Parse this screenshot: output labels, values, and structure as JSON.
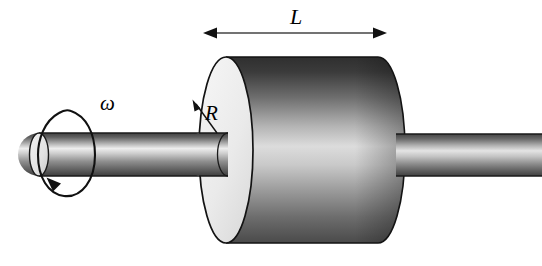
{
  "figure": {
    "background_color": "#ffffff",
    "width": 542,
    "height": 266,
    "labels": {
      "length": "L",
      "radius": "R",
      "angular_velocity": "ω"
    },
    "annotations": [
      {
        "name": "length-dimension",
        "symbol": "L",
        "kind": "double-headed-arrow",
        "meaning": "axial length of the cylinder"
      },
      {
        "name": "radius-dimension",
        "symbol": "R",
        "kind": "single-headed-leader-arrow",
        "meaning": "radius of the cylinder front face"
      },
      {
        "name": "rotation-indicator",
        "symbol": "ω",
        "kind": "circular-arrow",
        "meaning": "angular velocity about the shaft axis"
      }
    ],
    "colors": {
      "outline": "#111111",
      "face_light": "#efefef",
      "body_dark": "#3a3a3a",
      "body_highlight": "#dcdcdc",
      "shaft_dark": "#4a4a4a",
      "shaft_highlight": "#ececec",
      "arrow": "#111111"
    },
    "parts": [
      {
        "name": "left-shaft",
        "shape": "cylinder"
      },
      {
        "name": "rotor-cylinder",
        "shape": "cylinder"
      },
      {
        "name": "right-shaft",
        "shape": "cylinder"
      }
    ]
  }
}
